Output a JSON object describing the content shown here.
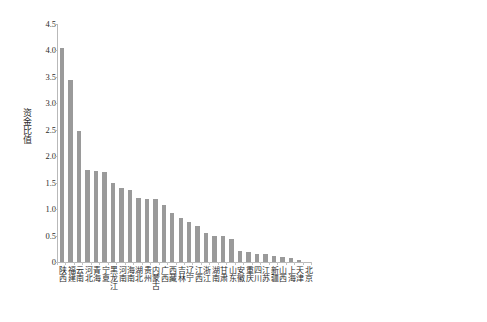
{
  "chart_data": {
    "type": "bar",
    "title": "",
    "xlabel": "",
    "ylabel": "资金比值",
    "ylim": [
      0,
      4.5
    ],
    "ytick_labels": [
      "4.5",
      "4.0",
      "3.5",
      "3.0",
      "2.5",
      "2.0",
      "1.5",
      "1.0",
      "0.5",
      "0"
    ],
    "ytick_values": [
      4.5,
      4.0,
      3.5,
      3.0,
      2.5,
      2.0,
      1.5,
      1.0,
      0.5,
      0
    ],
    "grid": false,
    "legend": false,
    "bar_color": "#9a9a9a",
    "axis_color": "#b9b9b9",
    "categories": [
      "陕西",
      "福建",
      "云南",
      "河北",
      "青海",
      "宁夏",
      "黑龙江",
      "河南",
      "海南",
      "湖北",
      "贵州",
      "内蒙古",
      "广西",
      "西藏",
      "吉林",
      "辽宁",
      "江西",
      "浙江",
      "湖南",
      "甘肃",
      "山东",
      "安徽",
      "重庆",
      "四川",
      "江苏",
      "新疆",
      "山西",
      "上海",
      "天津",
      "北京"
    ],
    "values": [
      4.05,
      3.44,
      2.48,
      1.74,
      1.72,
      1.71,
      1.5,
      1.4,
      1.36,
      1.21,
      1.2,
      1.2,
      1.08,
      0.92,
      0.83,
      0.76,
      0.69,
      0.55,
      0.5,
      0.49,
      0.43,
      0.21,
      0.19,
      0.16,
      0.15,
      0.12,
      0.1,
      0.07,
      0.03,
      0.0
    ]
  }
}
